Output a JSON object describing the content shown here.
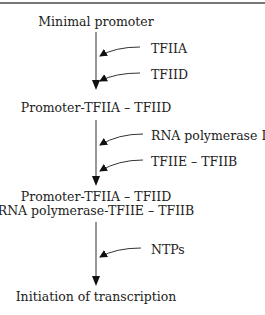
{
  "diagram": {
    "nodes": [
      "Minimal promoter",
      "Promoter-TFIIA – TFIID",
      "Promoter-TFIIA – TFIID",
      "RNA polymerase-TFIIE – TFIIB",
      "Initiation of transcription"
    ],
    "inputs": {
      "step1": [
        "TFIIA",
        "TFIID"
      ],
      "step2": [
        "RNA polymerase II",
        "TFIIE – TFIIB"
      ],
      "step3": [
        "NTPs"
      ]
    }
  }
}
